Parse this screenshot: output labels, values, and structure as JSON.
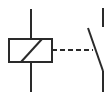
{
  "diagram": {
    "stroke_color": "#2a2a2a",
    "background": "#ffffff",
    "elements": {
      "coil": {
        "type": "relay-coil",
        "x": 9,
        "y": 39,
        "width": 43,
        "height": 23
      },
      "mechanical_link": {
        "type": "dashed-line",
        "style": "dashed"
      },
      "contact": {
        "type": "normally-open-switch"
      }
    }
  }
}
